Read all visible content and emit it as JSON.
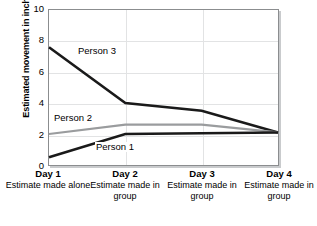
{
  "chart_data": {
    "type": "line",
    "title": "",
    "xlabel": "",
    "ylabel": "Estimated movement in inches",
    "categories": [
      "Day 1",
      "Day 2",
      "Day 3",
      "Day 4"
    ],
    "category_sublabels": [
      "Estimate made alone",
      "Estimate made in group",
      "Estimate made in group",
      "Estimate made in group"
    ],
    "x_tick_labels": [
      "Day 1",
      "Day 2",
      "Day 3",
      "Day 4"
    ],
    "y_tick_labels": [
      "0",
      "2",
      "4",
      "6",
      "8",
      "10"
    ],
    "y_tick_values": [
      0,
      2,
      4,
      6,
      8,
      10
    ],
    "ylim": [
      0,
      10
    ],
    "xlim": [
      1,
      4
    ],
    "grid": true,
    "legend_position": "inline-annotations",
    "series": [
      {
        "name": "Person 3",
        "color": "#1a1a1a",
        "values": [
          7.6,
          4.0,
          3.5,
          2.1
        ]
      },
      {
        "name": "Person 2",
        "color": "#9a9c9e",
        "values": [
          2.0,
          2.6,
          2.6,
          2.1
        ]
      },
      {
        "name": "Person 1",
        "color": "#1a1a1a",
        "values": [
          0.5,
          2.0,
          2.05,
          2.1
        ]
      }
    ],
    "annotations": [
      {
        "text": "Person 3",
        "x": 1.45,
        "y": 6.6
      },
      {
        "text": "Person 2",
        "x": 1.12,
        "y": 3.0
      },
      {
        "text": "Person 1",
        "x": 1.62,
        "y": 1.15
      }
    ]
  },
  "credit": {
    "text": "© Cengage Learning"
  }
}
